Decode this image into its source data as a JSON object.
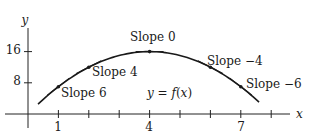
{
  "chart_data": {
    "type": "line",
    "title": "",
    "xlabel": "x",
    "ylabel": "y",
    "function_label": "y = f(x)",
    "function": "f(x) = 16 - (x-4)^2",
    "domain": [
      0.33,
      7.6
    ],
    "xlim": [
      -0.5,
      8.8
    ],
    "ylim": [
      -3.5,
      22
    ],
    "x_ticks": [
      1,
      2,
      3,
      4,
      5,
      6,
      7,
      8
    ],
    "x_tick_labels": [
      {
        "value": 1,
        "label": "1"
      },
      {
        "value": 4,
        "label": "4"
      },
      {
        "value": 7,
        "label": "7"
      }
    ],
    "y_ticks": [
      8,
      16
    ],
    "y_tick_labels": [
      {
        "value": 8,
        "label": "8"
      },
      {
        "value": 16,
        "label": "16"
      }
    ],
    "grid": false,
    "series": [
      {
        "name": "f(x)",
        "x": [
          0.5,
          1,
          2,
          3,
          4,
          5,
          6,
          7,
          7.5
        ],
        "values": [
          3.75,
          7,
          12,
          15,
          16,
          15,
          12,
          7,
          3.75
        ]
      }
    ],
    "tangent_points": [
      {
        "x": 1,
        "y": 7,
        "slope": 6,
        "label": "Slope 6"
      },
      {
        "x": 2,
        "y": 12,
        "slope": 4,
        "label": "Slope 4"
      },
      {
        "x": 4,
        "y": 16,
        "slope": 0,
        "label": "Slope 0"
      },
      {
        "x": 6,
        "y": 12,
        "slope": -4,
        "label": "Slope −4"
      },
      {
        "x": 7,
        "y": 7,
        "slope": -6,
        "label": "Slope −6"
      }
    ]
  },
  "axes": {
    "x_label": "x",
    "y_label": "y"
  },
  "labels": {
    "slope6": "Slope 6",
    "slope4": "Slope 4",
    "slope0": "Slope 0",
    "slope_neg4": "Slope −4",
    "slope_neg6": "Slope −6",
    "fn_y": "y",
    "fn_eq": " = ",
    "fn_f": "f",
    "fn_paren_open": "(",
    "fn_x": "x",
    "fn_paren_close": ")"
  },
  "ticks": {
    "x1": "1",
    "x4": "4",
    "x7": "7",
    "y8": "8",
    "y16": "16"
  }
}
